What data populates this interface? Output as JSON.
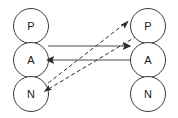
{
  "diagram": {
    "type": "directed-graph",
    "background_color": "#ffffff",
    "node_fill": "#ffffff",
    "node_stroke": "#3a3a3a",
    "solid_edge_color": "#4a4a4a",
    "dashed_edge_color": "#2e2e2e",
    "label_color": "#1a1a1a",
    "left_column": {
      "name": "left-group",
      "nodes": [
        {
          "id": "left-p",
          "label": "P",
          "cx": 31,
          "cy": 26,
          "r": 17.5
        },
        {
          "id": "left-a",
          "label": "A",
          "cx": 31,
          "cy": 60,
          "r": 17.5
        },
        {
          "id": "left-n",
          "label": "N",
          "cx": 31,
          "cy": 94,
          "r": 17.5
        }
      ]
    },
    "right_column": {
      "name": "right-group",
      "nodes": [
        {
          "id": "right-p",
          "label": "P",
          "cx": 148,
          "cy": 26,
          "r": 17.5
        },
        {
          "id": "right-a",
          "label": "A",
          "cx": 148,
          "cy": 60,
          "r": 17.5
        },
        {
          "id": "right-n",
          "label": "N",
          "cx": 148,
          "cy": 94,
          "r": 17.5
        }
      ]
    },
    "edges": [
      {
        "id": "edge-la-to-ra",
        "from": "left-a",
        "to": "right-a",
        "style": "solid",
        "x1": 48,
        "y1": 46,
        "x2": 131,
        "y2": 46,
        "arrow_at": "end"
      },
      {
        "id": "edge-ra-to-la",
        "from": "right-a",
        "to": "left-a",
        "style": "solid",
        "x1": 131,
        "y1": 60,
        "x2": 46,
        "y2": 60,
        "arrow_at": "end"
      },
      {
        "id": "edge-ln-to-rp",
        "from": "left-n",
        "to": "right-p",
        "style": "dashed",
        "x1": 43,
        "y1": 87,
        "x2": 128,
        "y2": 21,
        "arrow_at": "end"
      },
      {
        "id": "edge-rp-to-ln",
        "from": "right-p",
        "to": "left-n",
        "style": "dashed",
        "x1": 137,
        "y1": 36,
        "x2": 44,
        "y2": 92,
        "arrow_at": "end"
      }
    ]
  }
}
